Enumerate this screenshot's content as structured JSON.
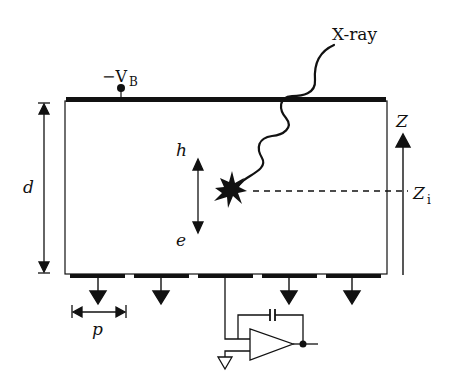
{
  "diagram": {
    "title": "",
    "labels": {
      "bias_voltage": "−V",
      "bias_voltage_sub": "B",
      "xray": "X-ray",
      "thickness": "d",
      "hole": "h",
      "electron": "e",
      "pitch": "p",
      "depth_axis": "Z",
      "interaction_depth": "Z",
      "interaction_depth_sub": "i"
    },
    "elements": {
      "top_electrode": "continuous cathode",
      "bottom_pixels": 5,
      "grounded_pixels": 4,
      "readout": "charge-sensitive preamplifier with feedback capacitor"
    },
    "colors": {
      "ink": "#111111",
      "background": "#ffffff"
    }
  }
}
